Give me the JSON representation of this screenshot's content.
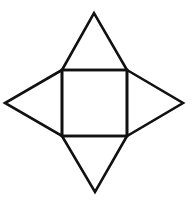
{
  "diagram": {
    "type": "net-of-square-pyramid",
    "width": 195,
    "height": 204,
    "background": "#ffffff",
    "stroke_color": "#111111",
    "stroke_width": 2.6,
    "base_square": {
      "points": [
        [
          62,
          70
        ],
        [
          127,
          70
        ],
        [
          127,
          136
        ],
        [
          62,
          136
        ]
      ]
    },
    "triangles": {
      "top": {
        "points": [
          [
            62,
            70
          ],
          [
            94,
            13
          ],
          [
            127,
            70
          ]
        ]
      },
      "right": {
        "points": [
          [
            127,
            70
          ],
          [
            183,
            103
          ],
          [
            127,
            136
          ]
        ]
      },
      "bottom": {
        "points": [
          [
            62,
            136
          ],
          [
            95,
            192
          ],
          [
            127,
            136
          ]
        ]
      },
      "left": {
        "points": [
          [
            62,
            70
          ],
          [
            5,
            103
          ],
          [
            62,
            136
          ]
        ]
      }
    }
  }
}
